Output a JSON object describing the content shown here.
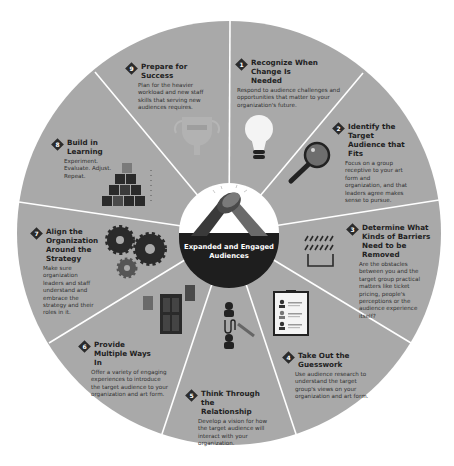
{
  "diagram": {
    "type": "circular-cycle",
    "center": {
      "label": "Expanded and Engaged Audiences",
      "icon": "clasped-hands-icon"
    },
    "segments": [
      {
        "number": "1",
        "title": "Recognize When Change Is Needed",
        "description": "Respond to audience challenges and opportunities that matter to your organization's future.",
        "icon": "lightbulb-icon"
      },
      {
        "number": "2",
        "title": "Identify the Target Audience that Fits",
        "description": "Focus on a group receptive to your art form and organization, and that leaders agree makes sense to pursue.",
        "icon": "magnifying-glass-icon"
      },
      {
        "number": "3",
        "title": "Determine What Kinds of Barriers Need to be Removed",
        "description": "Are the obstacles between you and the target group practical matters like ticket pricing, people's perceptions or the audience experience itself?",
        "icon": "barrier-icon"
      },
      {
        "number": "4",
        "title": "Take Out the Guesswork",
        "description": "Use audience research to understand the target group's views on your organization and art form.",
        "icon": "clipboard-survey-icon"
      },
      {
        "number": "5",
        "title": "Think Through the Relationship",
        "description": "Develop a vision for how the target audience will interact with your organization.",
        "icon": "people-connection-icon"
      },
      {
        "number": "6",
        "title": "Provide Multiple Ways In",
        "description": "Offer a variety of engaging experiences to introduce the target audience to your organization and art form.",
        "icon": "doors-icon"
      },
      {
        "number": "7",
        "title": "Align the Organization Around the Strategy",
        "description": "Make sure organization leaders and staff understand and embrace the strategy and their roles in it.",
        "icon": "gears-icon"
      },
      {
        "number": "8",
        "title": "Build in Learning",
        "description": "Experiment. Evaluate. Adjust. Repeat.",
        "icon": "building-blocks-icon"
      },
      {
        "number": "9",
        "title": "Prepare for Success",
        "description": "Plan for the heavier workload and new staff skills that serving new audiences requires.",
        "icon": "trophy-icon"
      }
    ]
  },
  "colors": {
    "wheel_fill": "#a9a9a9",
    "divider": "#ffffff",
    "hub_fill": "#ffffff",
    "hub_band": "#1e1e1e",
    "text_dark": "#222222",
    "icon_dark": "#2a2a2a"
  }
}
